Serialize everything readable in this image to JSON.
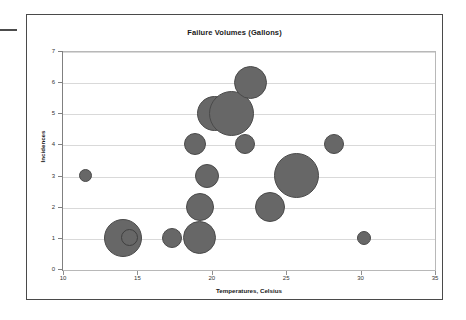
{
  "chart_data": {
    "type": "scatter",
    "title": "Failure Volumes (Gallons)",
    "xlabel": "Temperatures, Celsius",
    "ylabel": "Incidences",
    "xlim": [
      10,
      35
    ],
    "ylim": [
      0,
      7
    ],
    "xticks": [
      "10",
      "15",
      "20",
      "25",
      "30",
      "35"
    ],
    "yticks": [
      "0",
      "1",
      "2",
      "3",
      "4",
      "5",
      "6",
      "7"
    ],
    "grid": "horizontal",
    "legend": "none",
    "bubble_color": "#676767",
    "bubble_border_color": "#4a4a4a",
    "points": [
      {
        "name": "bubble-11.5-3",
        "x": 11.5,
        "y": 3,
        "size": 13
      },
      {
        "name": "bubble-14-1",
        "x": 14.0,
        "y": 1,
        "size": 38
      },
      {
        "name": "bubble-14.5-1",
        "x": 14.5,
        "y": 1,
        "size": 17,
        "style": "ring"
      },
      {
        "name": "bubble-17.3-1",
        "x": 17.3,
        "y": 1,
        "size": 20
      },
      {
        "name": "bubble-19.2-1",
        "x": 19.2,
        "y": 1,
        "size": 33
      },
      {
        "name": "bubble-19.2-2",
        "x": 19.2,
        "y": 2,
        "size": 28
      },
      {
        "name": "bubble-19.7-3",
        "x": 19.7,
        "y": 3,
        "size": 24
      },
      {
        "name": "bubble-18.9-4",
        "x": 18.9,
        "y": 4,
        "size": 22
      },
      {
        "name": "bubble-20.2-5",
        "x": 20.2,
        "y": 5,
        "size": 35
      },
      {
        "name": "bubble-21.3-5",
        "x": 21.3,
        "y": 5,
        "size": 45
      },
      {
        "name": "bubble-22.2-4",
        "x": 22.2,
        "y": 4,
        "size": 20
      },
      {
        "name": "bubble-22.6-6",
        "x": 22.6,
        "y": 6,
        "size": 33
      },
      {
        "name": "bubble-23.9-2",
        "x": 23.9,
        "y": 2,
        "size": 30
      },
      {
        "name": "bubble-25.7-3",
        "x": 25.7,
        "y": 3,
        "size": 45
      },
      {
        "name": "bubble-28.2-4",
        "x": 28.2,
        "y": 4,
        "size": 20
      },
      {
        "name": "bubble-30.2-1",
        "x": 30.2,
        "y": 1,
        "size": 14
      }
    ]
  }
}
